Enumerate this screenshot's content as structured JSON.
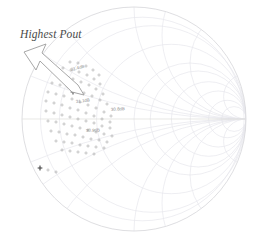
{
  "chart_data": {
    "type": "scatter",
    "title": "",
    "subtitle": "",
    "xlabel": "",
    "ylabel": "",
    "grid": true,
    "legend_position": "none",
    "chart_kind": "smith-chart-load-pull",
    "axis_ranges": {
      "real_reflection": [
        -1,
        1
      ],
      "imag_reflection": [
        -1,
        1
      ]
    },
    "smith_grid": {
      "outer_circle_center": [
        134,
        119
      ],
      "outer_circle_radius": 112,
      "resistance_circles": [
        0.2,
        0.5,
        1,
        2,
        5
      ],
      "reactance_arcs": [
        0.2,
        0.5,
        1,
        2,
        5,
        -0.2,
        -0.5,
        -1,
        -2,
        -5
      ],
      "grid_color": "#e8e8ec",
      "outline_color": "#dcdce2"
    },
    "annotations": [
      {
        "id": "highest-pout",
        "text": "Highest Pout",
        "style": "italic",
        "x": 20,
        "y": 30,
        "color": "#4a4a4a"
      }
    ],
    "arrow": {
      "id": "pout-arrow",
      "label": "block-arrow-pointing-to-highest-pout",
      "from": [
        24,
        53
      ],
      "to": [
        74,
        92
      ],
      "color": "#9a9a9a",
      "fill": "#ffffff"
    },
    "contour_labels": [
      {
        "text": "31.4dB",
        "x": 71,
        "y": 68,
        "rotate": -14
      },
      {
        "text": "31.1dB",
        "x": 76,
        "y": 100,
        "rotate": -6
      },
      {
        "text": "30.8dB",
        "x": 111,
        "y": 108,
        "rotate": -4
      },
      {
        "text": "30.9dB",
        "x": 86,
        "y": 129,
        "rotate": -3
      }
    ],
    "series": [
      {
        "name": "load-pull measurement points",
        "marker": "plus",
        "color": "#9d9d9d",
        "points": [
          [
            70,
            62
          ],
          [
            78,
            63
          ],
          [
            86,
            66
          ],
          [
            93,
            70
          ],
          [
            99,
            75
          ],
          [
            63,
            68
          ],
          [
            71,
            70
          ],
          [
            79,
            72
          ],
          [
            87,
            75
          ],
          [
            94,
            79
          ],
          [
            100,
            84
          ],
          [
            57,
            75
          ],
          [
            65,
            77
          ],
          [
            73,
            79
          ],
          [
            81,
            82
          ],
          [
            89,
            85
          ],
          [
            96,
            89
          ],
          [
            103,
            94
          ],
          [
            52,
            83
          ],
          [
            60,
            85
          ],
          [
            68,
            87
          ],
          [
            76,
            90
          ],
          [
            84,
            93
          ],
          [
            92,
            96
          ],
          [
            100,
            100
          ],
          [
            107,
            104
          ],
          [
            48,
            92
          ],
          [
            56,
            94
          ],
          [
            64,
            96
          ],
          [
            72,
            99
          ],
          [
            80,
            102
          ],
          [
            88,
            105
          ],
          [
            96,
            108
          ],
          [
            104,
            112
          ],
          [
            111,
            116
          ],
          [
            46,
            101
          ],
          [
            54,
            103
          ],
          [
            62,
            105
          ],
          [
            70,
            108
          ],
          [
            78,
            110
          ],
          [
            86,
            113
          ],
          [
            94,
            116
          ],
          [
            102,
            119
          ],
          [
            110,
            122
          ],
          [
            46,
            111
          ],
          [
            54,
            113
          ],
          [
            62,
            115
          ],
          [
            70,
            117
          ],
          [
            78,
            119
          ],
          [
            86,
            121
          ],
          [
            94,
            123
          ],
          [
            102,
            126
          ],
          [
            110,
            128
          ],
          [
            48,
            121
          ],
          [
            56,
            122
          ],
          [
            64,
            124
          ],
          [
            72,
            126
          ],
          [
            80,
            128
          ],
          [
            88,
            130
          ],
          [
            96,
            132
          ],
          [
            104,
            134
          ],
          [
            112,
            136
          ],
          [
            51,
            131
          ],
          [
            59,
            132
          ],
          [
            67,
            134
          ],
          [
            75,
            135
          ],
          [
            83,
            137
          ],
          [
            91,
            139
          ],
          [
            99,
            140
          ],
          [
            107,
            142
          ],
          [
            56,
            141
          ],
          [
            64,
            142
          ],
          [
            72,
            143
          ],
          [
            80,
            145
          ],
          [
            88,
            146
          ],
          [
            96,
            147
          ],
          [
            104,
            148
          ],
          [
            62,
            150
          ],
          [
            70,
            151
          ],
          [
            78,
            152
          ],
          [
            86,
            153
          ],
          [
            94,
            154
          ],
          [
            40,
            168
          ],
          [
            48,
            170
          ],
          [
            56,
            172
          ]
        ]
      },
      {
        "name": "optimum point",
        "marker": "plus-bold",
        "color": "#4a4a4a",
        "points": [
          [
            40,
            168
          ],
          [
            73,
            92
          ]
        ]
      }
    ]
  },
  "figure": {
    "background": "#ffffff",
    "width": 259,
    "height": 238
  }
}
